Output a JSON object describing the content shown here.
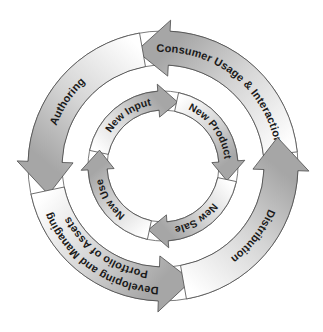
{
  "diagram": {
    "title": "",
    "center": [
      163,
      166
    ],
    "outer_ring": {
      "r_in": 101,
      "r_out": 135,
      "barb": 11,
      "head_deg": 16,
      "direction": "counterclockwise",
      "arrows": [
        {
          "id": "consumer-usage",
          "tail_deg": -6,
          "tip_deg": -103,
          "labels": [
            {
              "text": "Consumer Usage & Interaction",
              "center_deg": -52,
              "r": 118
            }
          ]
        },
        {
          "id": "authoring",
          "tail_deg": -100,
          "tip_deg": -194,
          "labels": [
            {
              "text": "Authoring",
              "center_deg": -146,
              "r": 118
            }
          ]
        },
        {
          "id": "developing",
          "tail_deg": -192,
          "tip_deg": -284,
          "labels": [
            {
              "text": "Developing and Managing",
              "center_deg": -235,
              "r": 125
            },
            {
              "text": "Portfolio of Assets",
              "center_deg": -235,
              "r": 110
            }
          ]
        },
        {
          "id": "distribution",
          "tail_deg": -280,
          "tip_deg": -374,
          "labels": [
            {
              "text": "Distribution",
              "center_deg": -322,
              "r": 118
            }
          ]
        }
      ]
    },
    "inner_ring": {
      "r_in": 56,
      "r_out": 75,
      "barb": 7,
      "head_deg": 17,
      "direction": "clockwise",
      "arrows": [
        {
          "id": "new-input",
          "tail_deg": 192,
          "tip_deg": 283,
          "labels": [
            {
              "text": "New Input",
              "center_deg": 236,
              "r": 65.5
            }
          ]
        },
        {
          "id": "new-product",
          "tail_deg": 282,
          "tip_deg": 373,
          "labels": [
            {
              "text": "New Product",
              "center_deg": 324,
              "r": 65.5
            }
          ]
        },
        {
          "id": "new-sale",
          "tail_deg": 12,
          "tip_deg": 103,
          "labels": [
            {
              "text": "New Sale",
              "center_deg": 58,
              "r": 65.5
            }
          ]
        },
        {
          "id": "new-use",
          "tail_deg": 102,
          "tip_deg": 194,
          "labels": [
            {
              "text": "New Use",
              "center_deg": 148,
              "r": 65.5
            }
          ]
        }
      ]
    },
    "colors": {
      "arrow_head": "#a6a6a6",
      "arrow_tail": "#ffffff",
      "outline": "#4a4a4a",
      "text": "#1a1a1a"
    }
  }
}
